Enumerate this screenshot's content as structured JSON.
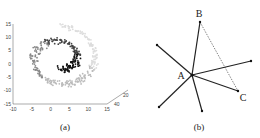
{
  "panels": [
    {
      "id": "a",
      "caption": "(a)",
      "kind": "3d-scatter-swiss-roll",
      "chart_data": {
        "type": "scatter",
        "title": "",
        "y_ticks": [
          "15",
          "10",
          "5",
          "0",
          "-5",
          "-10",
          "-15"
        ],
        "x_ticks": [
          "-10",
          "-5",
          "0",
          "5",
          "10",
          "15"
        ],
        "z_ticks": [
          "40",
          "20",
          "0"
        ],
        "ylim": [
          -15,
          15
        ],
        "xlim": [
          -10,
          15
        ],
        "zlim": [
          0,
          40
        ],
        "color_gradient": [
          "#dddddd",
          "#bbbbbb",
          "#888888",
          "#444444",
          "#111111"
        ],
        "description": "Swiss-roll shaped point cloud colored by position along the spiral, from light gray (outer) to black (inner end)"
      }
    },
    {
      "id": "b",
      "caption": "(b)",
      "kind": "neighbor-graph",
      "center": "A",
      "labels": {
        "A": "A",
        "B": "B",
        "C": "C"
      },
      "edges_solid": [
        [
          "A",
          "B"
        ],
        [
          "A",
          "upper-left"
        ],
        [
          "A",
          "right"
        ],
        [
          "A",
          "C"
        ],
        [
          "A",
          "lower-left"
        ],
        [
          "A",
          "bottom"
        ]
      ],
      "edges_dashed": [
        [
          "B",
          "C"
        ]
      ]
    }
  ]
}
